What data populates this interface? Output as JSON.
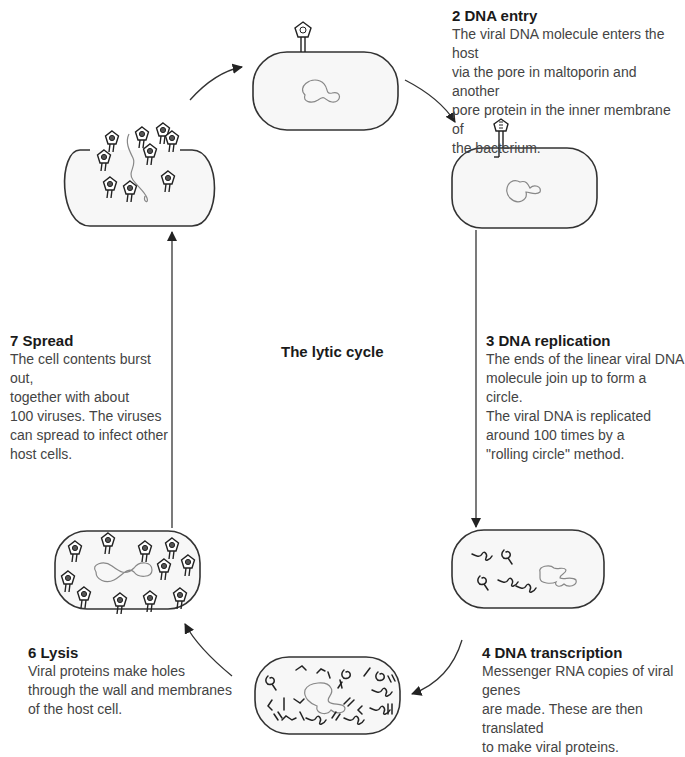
{
  "diagram": {
    "title": "The lytic cycle",
    "steps": [
      {
        "number": "2",
        "title": "2 DNA entry",
        "description": "The viral DNA molecule enters the host\nvia the pore in maltoporin and another\npore protein in the inner membrane of\nthe bacterium."
      },
      {
        "number": "3",
        "title": "3 DNA replication",
        "description": "The ends of the linear viral DNA\n molecule join up to form a circle.\nThe viral DNA is replicated\naround 100 times by a\n\"rolling circle\" method."
      },
      {
        "number": "4",
        "title": "4 DNA transcription",
        "description": "Messenger RNA copies of viral genes\nare made. These are then translated\nto make viral proteins."
      },
      {
        "number": "6",
        "title": "6 Lysis",
        "description": "Viral proteins make holes\nthrough the wall and membranes\nof the host cell."
      },
      {
        "number": "7",
        "title": "7 Spread",
        "description": "The cell contents burst out,\ntogether with about\n100 viruses. The viruses\ncan spread to infect other\nhost cells."
      }
    ],
    "cells": [
      {
        "id": "attachment",
        "label": "phage-attached-cell"
      },
      {
        "id": "dna-entry",
        "label": "dna-entry-cell"
      },
      {
        "id": "replication",
        "label": "replicated-dna-cell"
      },
      {
        "id": "transcription",
        "label": "transcription-cell"
      },
      {
        "id": "assembly",
        "label": "assembled-phages-cell"
      },
      {
        "id": "burst",
        "label": "burst-cell"
      }
    ],
    "colors": {
      "outline": "#333333",
      "cell_fill": "#f7f7f7",
      "dna": "#888888",
      "text": "#444444",
      "heading": "#1a1a1a"
    }
  }
}
